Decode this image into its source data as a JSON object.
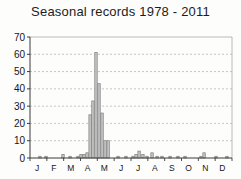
{
  "chart_data": {
    "type": "bar",
    "title": "Seasonal records 1978 - 2011",
    "xlabel": "",
    "ylabel": "",
    "ylim": [
      0,
      70
    ],
    "ytick_step": 10,
    "yticks": [
      0,
      10,
      20,
      30,
      40,
      50,
      60,
      70
    ],
    "month_labels": [
      "J",
      "F",
      "M",
      "A",
      "M",
      "J",
      "J",
      "A",
      "S",
      "O",
      "N",
      "D"
    ],
    "grid": "horizontal-dashed",
    "legend_position": "none",
    "bars": [
      {
        "month_pos": 0.59,
        "value": 1
      },
      {
        "month_pos": 0.95,
        "value": 1
      },
      {
        "month_pos": 1.96,
        "value": 2
      },
      {
        "month_pos": 2.38,
        "value": 1
      },
      {
        "month_pos": 2.85,
        "value": 1
      },
      {
        "month_pos": 3.03,
        "value": 2
      },
      {
        "month_pos": 3.21,
        "value": 2
      },
      {
        "month_pos": 3.39,
        "value": 3
      },
      {
        "month_pos": 3.57,
        "value": 25
      },
      {
        "month_pos": 3.74,
        "value": 33
      },
      {
        "month_pos": 3.92,
        "value": 61
      },
      {
        "month_pos": 4.1,
        "value": 43
      },
      {
        "month_pos": 4.28,
        "value": 26
      },
      {
        "month_pos": 4.46,
        "value": 10
      },
      {
        "month_pos": 4.64,
        "value": 10
      },
      {
        "month_pos": 5.23,
        "value": 1
      },
      {
        "month_pos": 5.7,
        "value": 1
      },
      {
        "month_pos": 6.12,
        "value": 1
      },
      {
        "month_pos": 6.3,
        "value": 2
      },
      {
        "month_pos": 6.48,
        "value": 4
      },
      {
        "month_pos": 6.71,
        "value": 2
      },
      {
        "month_pos": 6.95,
        "value": 1
      },
      {
        "month_pos": 7.25,
        "value": 3
      },
      {
        "month_pos": 7.55,
        "value": 1
      },
      {
        "month_pos": 7.84,
        "value": 1
      },
      {
        "month_pos": 8.32,
        "value": 1
      },
      {
        "month_pos": 8.79,
        "value": 1
      },
      {
        "month_pos": 9.21,
        "value": 1
      },
      {
        "month_pos": 10.16,
        "value": 1
      },
      {
        "month_pos": 10.34,
        "value": 3
      },
      {
        "month_pos": 11.05,
        "value": 1
      },
      {
        "month_pos": 11.7,
        "value": 1
      }
    ],
    "colors": {
      "background": "#fdfdfc",
      "bar_fill": "#c6c6c6",
      "bar_stroke": "#7d7d7d",
      "grid": "#b8b8b8",
      "axis": "#3a3a3a",
      "frame": "#a8a8a8",
      "text": "#161616"
    }
  }
}
